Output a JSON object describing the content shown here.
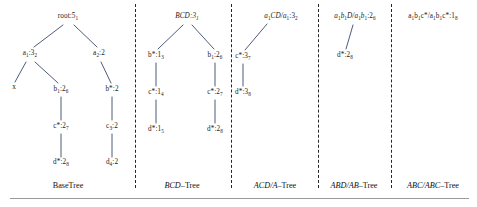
{
  "figure": {
    "line_color": "#3a4a66",
    "text_color": "#1a1a1a",
    "divider_color": "#262626",
    "baseline_color": "#9a9a9a"
  },
  "trees": [
    {
      "id": "base-tree",
      "caption": "BaseTree",
      "caption_italic_prefix": "",
      "caption_rest": "BaseTree",
      "nodes": [
        {
          "id": "root",
          "label": "root:5",
          "sub": "1",
          "x": 68,
          "y": 17
        },
        {
          "id": "a1",
          "label": "a",
          "sub": "1",
          "label2": ":3",
          "sub2": "2",
          "x": 30,
          "y": 54
        },
        {
          "id": "a2",
          "label": "a",
          "sub": "2",
          "label2": ":2",
          "sub2": "",
          "x": 99,
          "y": 54
        },
        {
          "id": "x",
          "label": "x",
          "sub": "",
          "x": 14,
          "y": 88
        },
        {
          "id": "b1",
          "label": "b",
          "sub": "1",
          "label2": ":2",
          "sub2": "6",
          "x": 61,
          "y": 90
        },
        {
          "id": "bstar",
          "label": "b*:2",
          "sub": "",
          "x": 112,
          "y": 90
        },
        {
          "id": "cstar",
          "label": "c*:2",
          "sub": "7",
          "x": 61,
          "y": 127
        },
        {
          "id": "c3",
          "label": "c",
          "sub": "3",
          "label2": ":2",
          "sub2": "",
          "x": 112,
          "y": 127
        },
        {
          "id": "dstar",
          "label": "d*:2",
          "sub": "8",
          "x": 61,
          "y": 163
        },
        {
          "id": "d4",
          "label": "d",
          "sub": "4",
          "label2": ":2",
          "sub2": "",
          "x": 112,
          "y": 163
        }
      ]
    },
    {
      "id": "bcd-tree",
      "caption": "BCD–Tree",
      "caption_italic_prefix": "BCD",
      "caption_rest": "–Tree",
      "nodes": [
        {
          "id": "bcd-root",
          "label": "BCD:3",
          "sub": "1",
          "x": 187,
          "y": 17
        },
        {
          "id": "bstar13",
          "label": "b*:1",
          "sub": "3",
          "x": 156,
          "y": 56
        },
        {
          "id": "b126",
          "label": "b",
          "sub": "1",
          "label2": ":2",
          "sub2": "6",
          "x": 215,
          "y": 56
        },
        {
          "id": "cstar14",
          "label": "c*:1",
          "sub": "4",
          "x": 156,
          "y": 93
        },
        {
          "id": "cstar27",
          "label": "c*:2",
          "sub": "7",
          "x": 215,
          "y": 93
        },
        {
          "id": "dstar15",
          "label": "d*:1",
          "sub": "5",
          "x": 156,
          "y": 130
        },
        {
          "id": "dstar28",
          "label": "d*:2",
          "sub": "8",
          "x": 215,
          "y": 130
        }
      ]
    },
    {
      "id": "acd-a-tree",
      "caption": "ACD/A–Tree",
      "caption_italic_prefix": "ACD/A",
      "caption_rest": "–Tree",
      "nodes": [
        {
          "id": "acd-root",
          "label": "a",
          "sub": "1",
          "label2": "CD/a",
          "sub2": "1",
          "label3": ":3",
          "sub3": "2",
          "x": 280,
          "y": 17
        },
        {
          "id": "cstar37",
          "label": "c*:3",
          "sub": "7",
          "x": 243,
          "y": 57
        },
        {
          "id": "dstar38",
          "label": "d*:3",
          "sub": "8",
          "x": 243,
          "y": 93
        }
      ]
    },
    {
      "id": "abd-ab-tree",
      "caption": "ABD/AB–Tree",
      "caption_italic_prefix": "ABD/AB",
      "caption_rest": "–Tree",
      "nodes": [
        {
          "id": "abd-root",
          "label": "a",
          "sub": "1",
          "label2": "b",
          "sub2": "1",
          "label3": "D/a",
          "sub3": "1",
          "label4": "b",
          "sub4": "1",
          "label5": ":2",
          "sub5": "6",
          "x": 355,
          "y": 17
        },
        {
          "id": "dstar28b",
          "label": "d*:2",
          "sub": "8",
          "x": 345,
          "y": 56
        }
      ]
    },
    {
      "id": "abc-abc-tree",
      "caption": "ABC/ABC–Tree",
      "caption_italic_prefix": "ABC/ABC",
      "caption_rest": "–Tree",
      "nodes": [
        {
          "id": "abc-root",
          "label": "a",
          "sub": "1",
          "label2": "b",
          "sub2": "1",
          "label3": "c*/a",
          "sub3": "1",
          "label4": "b",
          "sub4": "1",
          "label5": "c*:1",
          "sub5": "8",
          "x": 433,
          "y": 17
        }
      ]
    }
  ],
  "captions": [
    {
      "id": "caption-base",
      "italic": "",
      "rest": "BaseTree",
      "x": 68,
      "y": 186
    },
    {
      "id": "caption-bcd",
      "italic": "BCD",
      "rest": "–Tree",
      "x": 182,
      "y": 186
    },
    {
      "id": "caption-acd",
      "italic": "ACD/A",
      "rest": "–Tree",
      "x": 275,
      "y": 186
    },
    {
      "id": "caption-abd",
      "italic": "ABD/AB",
      "rest": "–Tree",
      "x": 354,
      "y": 186
    },
    {
      "id": "caption-abc",
      "italic": "ABC/ABC",
      "rest": "–Tree",
      "x": 433,
      "y": 186
    }
  ],
  "dividers": [
    {
      "id": "divider-1",
      "x": 135
    },
    {
      "id": "divider-2",
      "x": 231
    },
    {
      "id": "divider-3",
      "x": 318
    },
    {
      "id": "divider-4",
      "x": 391
    }
  ]
}
